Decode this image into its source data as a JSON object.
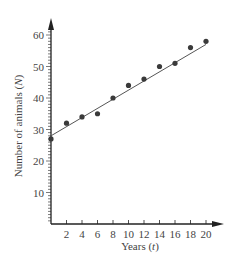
{
  "chart_data": {
    "type": "scatter",
    "title": "",
    "xlabel": "Years (t)",
    "ylabel": "Number of animals (N)",
    "xlim": [
      0,
      21
    ],
    "ylim": [
      0,
      63
    ],
    "x_ticks": [
      2,
      4,
      6,
      8,
      10,
      12,
      14,
      16,
      18,
      20
    ],
    "y_ticks": [
      10,
      20,
      30,
      40,
      50,
      60
    ],
    "grid": false,
    "legend": null,
    "series": [
      {
        "name": "observations",
        "type": "scatter",
        "x": [
          0,
          2,
          4,
          6,
          8,
          10,
          12,
          14,
          16,
          18,
          20
        ],
        "y": [
          27,
          32,
          34,
          35,
          40,
          44,
          46,
          50,
          51,
          56,
          58
        ]
      },
      {
        "name": "line of best fit",
        "type": "line",
        "x": [
          0,
          20
        ],
        "y": [
          28,
          57
        ]
      }
    ]
  },
  "labels": {
    "xlabel_text": "Years (",
    "xlabel_var": "t",
    "xlabel_end": ")",
    "ylabel_text": "Number of animals (",
    "ylabel_var": "N",
    "ylabel_end": ")"
  },
  "colors": {
    "axis": "#222222",
    "points": "#3a3a3a",
    "line": "#555555",
    "text": "#444444"
  }
}
